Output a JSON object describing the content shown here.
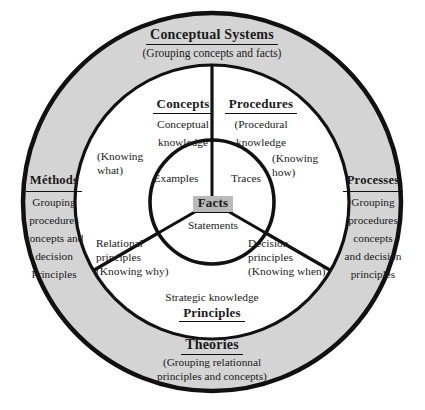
{
  "diagram": {
    "colors": {
      "ring_fill": "#d4d4d4",
      "inner_fill": "#ffffff",
      "stroke": "#111111",
      "facts_highlight": "#b9b9b9",
      "page_background": "#ffffff"
    },
    "geometry": {
      "center_x": 212,
      "center_y": 202,
      "outer_radius": 190,
      "middle_radius": 137,
      "inner_radius": 62,
      "spoke_angles_deg": [
        270,
        30,
        150
      ]
    }
  },
  "outer_ring": {
    "top": {
      "heading": "Conceptual Systems",
      "subtitle": "(Grouping concepts and facts)"
    },
    "bottom": {
      "heading": "Theories",
      "subtitle_line1": "(Grouping  relationnal",
      "subtitle_line2": "principles and concepts)"
    },
    "left": {
      "heading": "Méthods",
      "line1": "Grouping",
      "line2": "procedures",
      "line3": "concepts and",
      "line4": "decision",
      "line5": "Principles"
    },
    "right": {
      "heading": "Processes",
      "line1": "Grouping",
      "line2": "procedures",
      "line3": "concepts",
      "line4": "and decision",
      "line5": "principles"
    }
  },
  "middle_ring": {
    "concepts": {
      "heading": "Concepts",
      "line1": "Conceptual",
      "line2": "knowledge"
    },
    "procedures": {
      "heading": "Procedures",
      "line1": "(Procedural",
      "line2": "knowledge"
    },
    "knowing_what": {
      "line1": "(Knowing",
      "line2": "what)"
    },
    "knowing_how": {
      "line1": "(Knowing",
      "line2": "how)"
    },
    "relational": {
      "line1": "Relational",
      "line2": "principles",
      "line3": "(Knowing why)"
    },
    "decision": {
      "line1": "Decision",
      "line2": "principles",
      "line3": "(Knowing when)"
    },
    "principles": {
      "strategic": "Strategic knowledge",
      "heading": "Principles"
    }
  },
  "inner_circle": {
    "examples": "Examples",
    "traces": "Traces",
    "statements": "Statements",
    "facts": "Facts"
  }
}
